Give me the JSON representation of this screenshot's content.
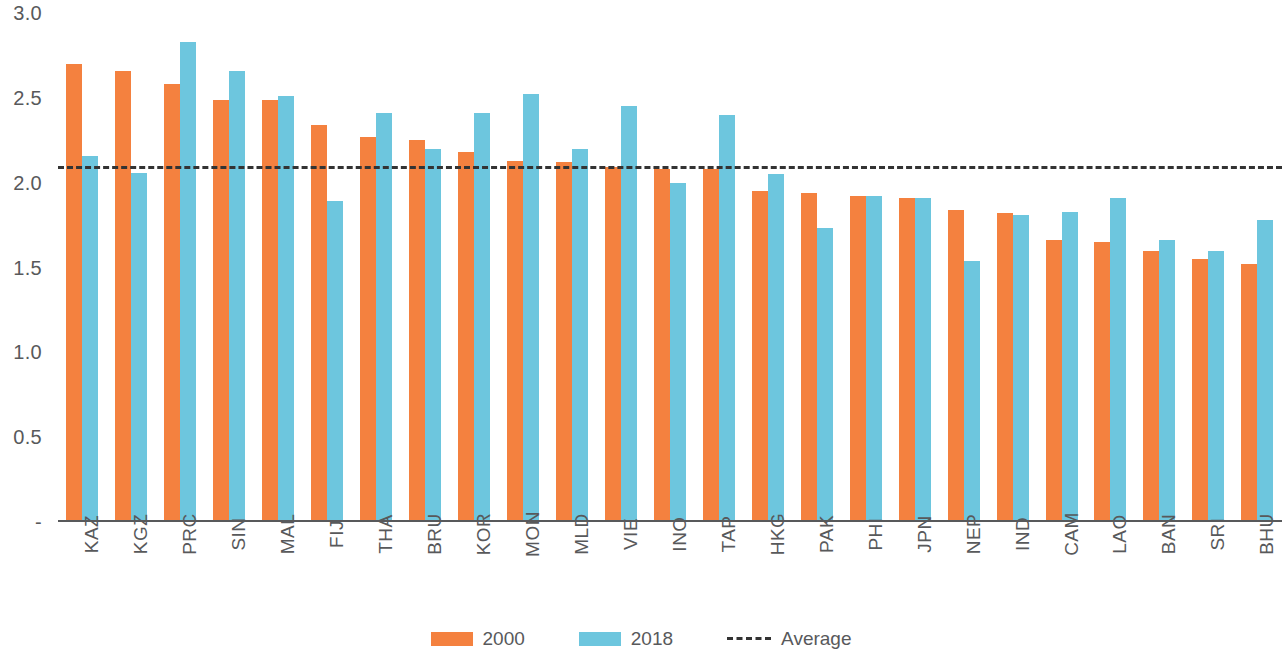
{
  "chart_data": {
    "type": "bar",
    "title": "",
    "subtitle": "",
    "xlabel": "",
    "ylabel": "",
    "ylim": [
      0,
      3.0
    ],
    "grid": false,
    "legend_position": "bottom-center",
    "y_ticks": [
      "3.0",
      "2.5",
      "2.0",
      "1.5",
      "1.0",
      "0.5",
      "-"
    ],
    "y_tick_values": [
      3.0,
      2.5,
      2.0,
      1.5,
      1.0,
      0.5,
      0
    ],
    "categories": [
      "KAZ",
      "KGZ",
      "PRC",
      "SIN",
      "MAL",
      "FIJ",
      "THA",
      "BRU",
      "KOR",
      "MON",
      "MLD",
      "VIE",
      "INO",
      "TAP",
      "HKG",
      "PAK",
      "PHI",
      "JPN",
      "NEP",
      "IND",
      "CAM",
      "LAO",
      "BAN",
      "SRI",
      "BHU"
    ],
    "series": [
      {
        "name": "2000",
        "color": "#F4813F",
        "values": [
          2.7,
          2.66,
          2.58,
          2.49,
          2.49,
          2.34,
          2.27,
          2.25,
          2.18,
          2.13,
          2.12,
          2.09,
          2.08,
          2.08,
          1.95,
          1.94,
          1.92,
          1.91,
          1.84,
          1.82,
          1.66,
          1.65,
          1.6,
          1.55,
          1.52
        ]
      },
      {
        "name": "2018",
        "color": "#6DC6DE",
        "values": [
          2.16,
          2.06,
          2.83,
          2.66,
          2.51,
          1.89,
          2.41,
          2.2,
          2.41,
          2.52,
          2.2,
          2.45,
          2.0,
          2.4,
          2.05,
          1.73,
          1.92,
          1.91,
          1.54,
          1.81,
          1.83,
          1.91,
          1.66,
          1.6,
          1.78
        ]
      }
    ],
    "average_line": {
      "name": "Average",
      "value": 2.08,
      "color": "#333333",
      "style": "dashed"
    }
  },
  "legend": {
    "items": [
      {
        "label": "2000",
        "swatch": "orange-swatch"
      },
      {
        "label": "2018",
        "swatch": "blue-swatch"
      },
      {
        "label": "Average",
        "swatch": "dashed-line-swatch"
      }
    ]
  }
}
